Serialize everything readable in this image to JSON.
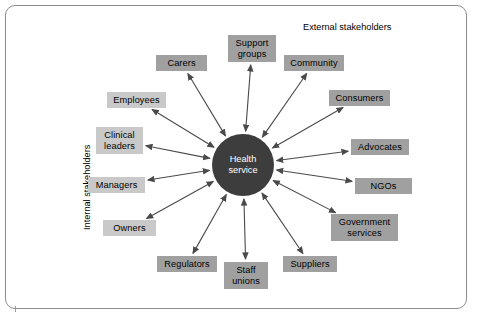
{
  "diagram": {
    "center": {
      "label": "Health\nservice",
      "fill": "#3d3d3d",
      "text_color": "#ffffff"
    },
    "sections": {
      "internal": "Internal stakeholders",
      "external": "External stakeholders"
    },
    "palette": {
      "box_dark": "#a0a0a0",
      "box_light": "#c9c9c9",
      "arrow": "#4a4a4a",
      "border": "#8d8d8d",
      "background": "#ffffff"
    },
    "nodes": [
      {
        "id": "carers",
        "label": "Carers",
        "group": "external",
        "shade": "dark",
        "x": 156,
        "y": 55,
        "w": 51,
        "h": 16
      },
      {
        "id": "support",
        "label": "Support\ngroups",
        "group": "external",
        "shade": "dark",
        "x": 228,
        "y": 35,
        "w": 48,
        "h": 27
      },
      {
        "id": "community",
        "label": "Community",
        "group": "external",
        "shade": "dark",
        "x": 284,
        "y": 55,
        "w": 60,
        "h": 16
      },
      {
        "id": "consumers",
        "label": "Consumers",
        "group": "external",
        "shade": "dark",
        "x": 329,
        "y": 90,
        "w": 61,
        "h": 16
      },
      {
        "id": "advocates",
        "label": "Advocates",
        "group": "external",
        "shade": "dark",
        "x": 351,
        "y": 139,
        "w": 58,
        "h": 16
      },
      {
        "id": "ngos",
        "label": "NGOs",
        "group": "external",
        "shade": "dark",
        "x": 355,
        "y": 178,
        "w": 57,
        "h": 16
      },
      {
        "id": "government",
        "label": "Government\nservices",
        "group": "external",
        "shade": "dark",
        "x": 331,
        "y": 214,
        "w": 67,
        "h": 27
      },
      {
        "id": "suppliers",
        "label": "Suppliers",
        "group": "external",
        "shade": "dark",
        "x": 283,
        "y": 256,
        "w": 54,
        "h": 16
      },
      {
        "id": "staffunions",
        "label": "Staff\nunions",
        "group": "internal",
        "shade": "dark",
        "x": 224,
        "y": 262,
        "w": 44,
        "h": 27
      },
      {
        "id": "regulators",
        "label": "Regulators",
        "group": "external",
        "shade": "dark",
        "x": 157,
        "y": 256,
        "w": 60,
        "h": 16
      },
      {
        "id": "owners",
        "label": "Owners",
        "group": "internal",
        "shade": "light",
        "x": 103,
        "y": 220,
        "w": 53,
        "h": 16
      },
      {
        "id": "managers",
        "label": "Managers",
        "group": "internal",
        "shade": "light",
        "x": 88,
        "y": 177,
        "w": 57,
        "h": 16
      },
      {
        "id": "clinical",
        "label": "Clinical\nleaders",
        "group": "internal",
        "shade": "light",
        "x": 96,
        "y": 127,
        "w": 47,
        "h": 27
      },
      {
        "id": "employees",
        "label": "Employees",
        "group": "internal",
        "shade": "light",
        "x": 107,
        "y": 92,
        "w": 59,
        "h": 16
      }
    ],
    "links": [
      {
        "from": "center",
        "to": "carers",
        "bidirectional": true
      },
      {
        "from": "center",
        "to": "support",
        "bidirectional": true
      },
      {
        "from": "center",
        "to": "community",
        "bidirectional": true
      },
      {
        "from": "center",
        "to": "consumers",
        "bidirectional": true
      },
      {
        "from": "center",
        "to": "advocates",
        "bidirectional": true
      },
      {
        "from": "center",
        "to": "ngos",
        "bidirectional": true
      },
      {
        "from": "center",
        "to": "government",
        "bidirectional": true
      },
      {
        "from": "center",
        "to": "suppliers",
        "bidirectional": true
      },
      {
        "from": "center",
        "to": "staffunions",
        "bidirectional": true
      },
      {
        "from": "center",
        "to": "regulators",
        "bidirectional": true
      },
      {
        "from": "center",
        "to": "owners",
        "bidirectional": true
      },
      {
        "from": "center",
        "to": "managers",
        "bidirectional": true
      },
      {
        "from": "center",
        "to": "clinical",
        "bidirectional": true
      },
      {
        "from": "center",
        "to": "employees",
        "bidirectional": true
      }
    ]
  }
}
